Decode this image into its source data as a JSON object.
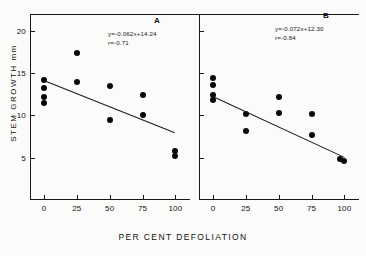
{
  "axes": {
    "ylabel": "STEM GROWTH  mm",
    "xlabel": "PER CENT DEFOLIATION",
    "yticks": [
      "5",
      "10",
      "15",
      "20"
    ],
    "xticks": [
      "0",
      "25",
      "50",
      "75",
      "100"
    ]
  },
  "panels": {
    "a": {
      "tag": "A",
      "equation": "y=-0.062x+14.24",
      "correlation": "r=-0.71"
    },
    "b": {
      "tag": "B",
      "equation": "y=-0.072x+12.30",
      "correlation": "r=-0.84"
    }
  },
  "chart_data": [
    {
      "type": "scatter",
      "title": "A",
      "xlabel": "PER CENT DEFOLIATION",
      "ylabel": "STEM GROWTH  mm",
      "xlim": [
        0,
        105
      ],
      "ylim": [
        0,
        22
      ],
      "xticks": [
        0,
        25,
        50,
        75,
        100
      ],
      "yticks": [
        5,
        10,
        15,
        20
      ],
      "grid": false,
      "legend": null,
      "points": [
        {
          "x": 0,
          "y": 14.2
        },
        {
          "x": 0,
          "y": 13.3
        },
        {
          "x": 0,
          "y": 12.2
        },
        {
          "x": 0,
          "y": 11.5
        },
        {
          "x": 25,
          "y": 17.4
        },
        {
          "x": 25,
          "y": 14.0
        },
        {
          "x": 50,
          "y": 13.5
        },
        {
          "x": 50,
          "y": 9.5
        },
        {
          "x": 75,
          "y": 12.4
        },
        {
          "x": 75,
          "y": 10.1
        },
        {
          "x": 100,
          "y": 5.8
        },
        {
          "x": 100,
          "y": 5.2
        }
      ],
      "fit": {
        "equation": "y=-0.062x+14.24",
        "r": -0.71,
        "slope": -0.062,
        "intercept": 14.24,
        "x_start": 0,
        "x_end": 100,
        "y_start": 14.24,
        "y_end": 8.04
      }
    },
    {
      "type": "scatter",
      "title": "B",
      "xlabel": "PER CENT DEFOLIATION",
      "ylabel": "STEM GROWTH  mm",
      "xlim": [
        0,
        105
      ],
      "ylim": [
        0,
        22
      ],
      "xticks": [
        0,
        25,
        50,
        75,
        100
      ],
      "yticks": [
        5,
        10,
        15,
        20
      ],
      "grid": false,
      "legend": null,
      "points": [
        {
          "x": 0,
          "y": 14.4
        },
        {
          "x": 0,
          "y": 13.6
        },
        {
          "x": 0,
          "y": 12.4
        },
        {
          "x": 0,
          "y": 11.8
        },
        {
          "x": 25,
          "y": 10.2
        },
        {
          "x": 25,
          "y": 8.2
        },
        {
          "x": 50,
          "y": 12.2
        },
        {
          "x": 50,
          "y": 10.3
        },
        {
          "x": 75,
          "y": 10.2
        },
        {
          "x": 75,
          "y": 7.7
        },
        {
          "x": 97,
          "y": 4.9
        },
        {
          "x": 100,
          "y": 4.6
        }
      ],
      "fit": {
        "equation": "y=-0.072x+12.30",
        "r": -0.84,
        "slope": -0.072,
        "intercept": 12.3,
        "x_start": 0,
        "x_end": 100,
        "y_start": 12.3,
        "y_end": 5.1
      }
    }
  ]
}
